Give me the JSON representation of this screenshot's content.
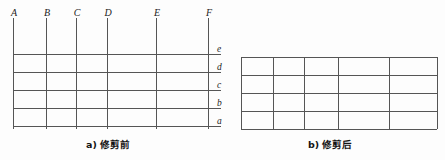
{
  "figure": {
    "title_a": "a) 修剪前",
    "title_b": "b) 修剪后"
  },
  "panel_a": {
    "caption": "a) 修剪前",
    "vertical_labels": [
      "A",
      "B",
      "C",
      "D",
      "E",
      "F"
    ],
    "horizontal_labels": [
      "e",
      "d",
      "c",
      "b",
      "a"
    ],
    "vertical_x": [
      13,
      46,
      76,
      107,
      156,
      208
    ],
    "horizontal_y": [
      54,
      72,
      90,
      108,
      126
    ],
    "vertical_top": 18,
    "vertical_bottom": 129,
    "horizontal_left": 13,
    "horizontal_right": 221,
    "columns": 5,
    "rows": 4,
    "label_y": 8
  },
  "panel_b": {
    "caption": "b) 修剪后",
    "vertical_x": [
      241,
      273,
      304,
      338,
      389,
      437
    ],
    "horizontal_y": [
      57,
      75,
      93,
      111,
      129
    ],
    "columns": 5,
    "rows": 4
  },
  "style": {
    "line_color": "#555555",
    "text_color": "#1c1c1c",
    "background": "#fdfdfd"
  }
}
